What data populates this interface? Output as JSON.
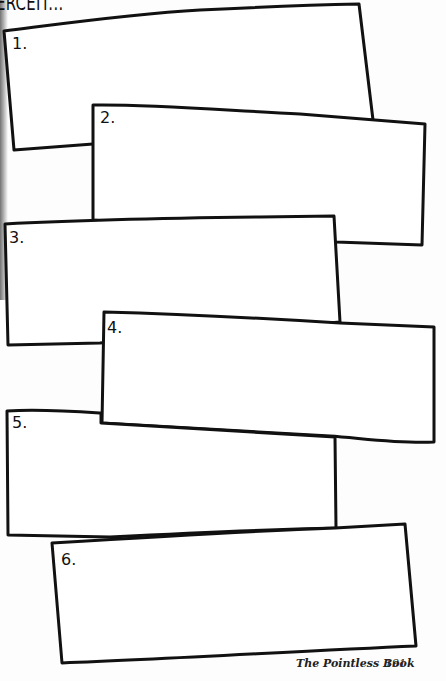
{
  "heading": "ERCEIT...",
  "boxes": [
    {
      "label": "1."
    },
    {
      "label": "2."
    },
    {
      "label": "3."
    },
    {
      "label": "4."
    },
    {
      "label": "5."
    },
    {
      "label": "6."
    }
  ],
  "footer": {
    "book_title": "The Pointless Book",
    "page_number": "191"
  }
}
